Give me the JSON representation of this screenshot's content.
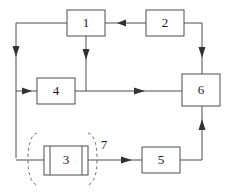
{
  "diagram": {
    "stroke_color": "#4d4d4d",
    "arrow_color": "#333333",
    "dashed_color": "#6b6b6b",
    "background_color": "#ffffff",
    "nodes": [
      {
        "id": "node-1",
        "label": "1",
        "x": 67,
        "y": 10,
        "w": 38,
        "h": 26,
        "shape": "rect"
      },
      {
        "id": "node-2",
        "label": "2",
        "x": 146,
        "y": 10,
        "w": 38,
        "h": 26,
        "shape": "rect"
      },
      {
        "id": "node-4",
        "label": "4",
        "x": 37,
        "y": 78,
        "w": 38,
        "h": 26,
        "shape": "rect"
      },
      {
        "id": "node-6",
        "label": "6",
        "x": 182,
        "y": 74,
        "w": 38,
        "h": 32,
        "shape": "rect"
      },
      {
        "id": "node-3",
        "label": "3",
        "x": 44,
        "y": 146,
        "w": 44,
        "h": 29,
        "shape": "heat-exchanger"
      },
      {
        "id": "node-5",
        "label": "5",
        "x": 142,
        "y": 147,
        "w": 38,
        "h": 26,
        "shape": "rect"
      }
    ],
    "tags": [
      {
        "id": "tag-7",
        "label": "7",
        "x": 103,
        "y": 145
      }
    ],
    "dashed_boundaries": [
      {
        "id": "boundary-left",
        "cx": 33,
        "top": 132,
        "bottom": 186
      },
      {
        "id": "boundary-right",
        "cx": 92,
        "top": 132,
        "bottom": 186
      }
    ],
    "connections": [
      {
        "id": "conn-2-to-1",
        "from": "node-2",
        "to": "node-1",
        "direction": "left"
      },
      {
        "id": "conn-1-to-left-bus",
        "from": "node-1",
        "to": "left-bus",
        "direction": "down"
      },
      {
        "id": "conn-1-to-4-junction",
        "from": "node-1",
        "to": "mid-junction",
        "direction": "down"
      },
      {
        "id": "conn-left-bus-to-4",
        "from": "left-bus",
        "to": "node-4",
        "direction": "right"
      },
      {
        "id": "conn-4-to-6",
        "from": "node-4",
        "to": "node-6",
        "direction": "right"
      },
      {
        "id": "conn-2-to-6",
        "from": "node-2",
        "to": "node-6",
        "direction": "down"
      },
      {
        "id": "conn-left-bus-to-3",
        "from": "left-bus",
        "to": "node-3",
        "direction": "right"
      },
      {
        "id": "conn-3-to-5",
        "from": "node-3",
        "to": "node-5",
        "direction": "right"
      },
      {
        "id": "conn-5-to-6",
        "from": "node-5",
        "to": "node-6",
        "direction": "up"
      }
    ]
  }
}
